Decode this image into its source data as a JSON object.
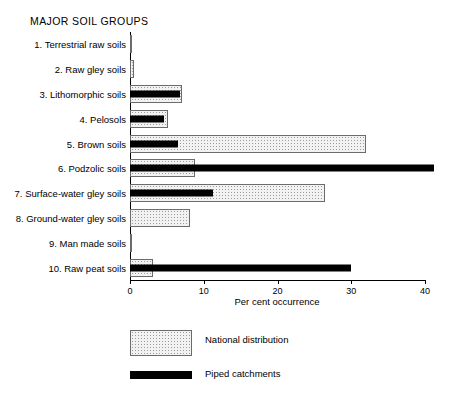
{
  "heading": "MAJOR SOIL GROUPS",
  "axis": {
    "title": "Per cent occurrence",
    "ticks": [
      "0",
      "10",
      "20",
      "30",
      "40"
    ]
  },
  "legend": {
    "items": [
      {
        "label": "National distribution",
        "swatch": "stippled-swatch",
        "color": "#f2f2f2"
      },
      {
        "label": "Piped catchments",
        "swatch": "solid-black-swatch",
        "color": "#000000"
      }
    ]
  },
  "chart_data": {
    "type": "bar",
    "orientation": "horizontal",
    "title": "MAJOR SOIL GROUPS",
    "xlabel": "Per cent occurrence",
    "ylabel": "",
    "xlim": [
      0,
      40
    ],
    "xticks": [
      0,
      10,
      20,
      30,
      40
    ],
    "grid": false,
    "legend_position": "bottom-left",
    "categories": [
      "1. Terrestrial raw soils",
      "2. Raw gley soils",
      "3. Lithomorphic soils",
      "4. Pelosols",
      "5. Brown soils",
      "6. Podzolic soils",
      "7. Surface-water gley soils",
      "8. Ground-water gley soils",
      "9. Man made soils",
      "10. Raw peat soils"
    ],
    "series": [
      {
        "name": "National distribution",
        "color": "#f2f2f2",
        "values": [
          0.2,
          0.6,
          7.0,
          5.2,
          32.0,
          8.8,
          26.4,
          8.1,
          0.3,
          3.1
        ]
      },
      {
        "name": "Piped catchments",
        "color": "#000000",
        "values": [
          0.0,
          0.0,
          6.8,
          4.6,
          6.5,
          41.2,
          11.2,
          0.0,
          0.0,
          30.0
        ]
      }
    ]
  }
}
